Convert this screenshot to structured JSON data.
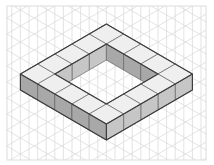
{
  "figure": {
    "outer_cubes_per_side": 5,
    "hole_cubes_per_side": 3,
    "layers": 1,
    "total_cubes": 16
  },
  "colors": {
    "background": "#ffffff",
    "grid_line": "#dcdcdc",
    "outline": "#3a3a3a",
    "inner_edge": "#6a6a6a",
    "top_face": "#efefef",
    "left_face": "#a8a8a8",
    "right_face": "#c6c6c6"
  }
}
